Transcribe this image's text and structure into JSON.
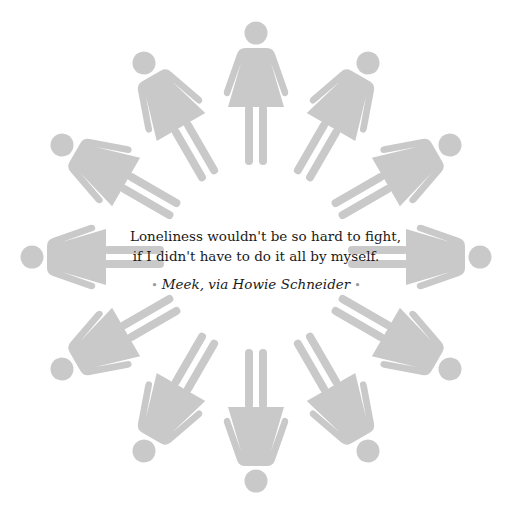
{
  "quote": {
    "lines": [
      "Loneliness wouldn't be so hard to fight,",
      "if I didn't have to do it all by myself."
    ],
    "attribution": "Meek, via Howie Schneider",
    "separator": "•"
  },
  "figures": {
    "count": 12,
    "icon": "female-pictogram-icon",
    "color": "#c9c9c9",
    "arrangement": "radial, heads outward, 30 degree spacing",
    "center": [
      256,
      257
    ]
  }
}
